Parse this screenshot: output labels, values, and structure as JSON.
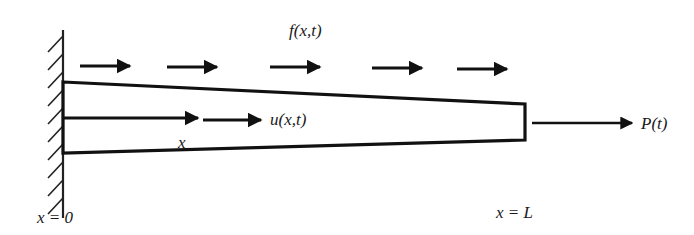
{
  "diagram": {
    "type": "tapered bar under axial load",
    "labels": {
      "distributed_load": "f(x,t)",
      "displacement": "u(x,t)",
      "coordinate": "x",
      "end_load": "P(t)",
      "left_boundary": "x = 0",
      "right_boundary": "x = L"
    },
    "elements": {
      "fixed_wall": "hatched fixed support at left end",
      "bar": "tapered bar, wide at x = 0, narrow at x = L",
      "distributed_load_arrows": 5,
      "end_force_arrow": "P(t) pointing right"
    },
    "colors": {
      "stroke": "#111111",
      "background": "#ffffff"
    }
  }
}
